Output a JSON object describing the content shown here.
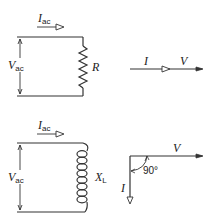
{
  "resistive_circuit": {
    "current_label": "I",
    "current_sub": "ac",
    "voltage_label": "V",
    "voltage_sub": "ac",
    "component_label": "R"
  },
  "resistive_phasor": {
    "current_label": "I",
    "voltage_label": "V"
  },
  "inductive_circuit": {
    "current_label": "I",
    "current_sub": "ac",
    "voltage_label": "V",
    "voltage_sub": "ac",
    "component_label": "X",
    "component_sub": "L"
  },
  "inductive_phasor": {
    "voltage_label": "V",
    "current_label": "I",
    "angle_label": "90°"
  },
  "colors": {
    "line": "#333333"
  }
}
